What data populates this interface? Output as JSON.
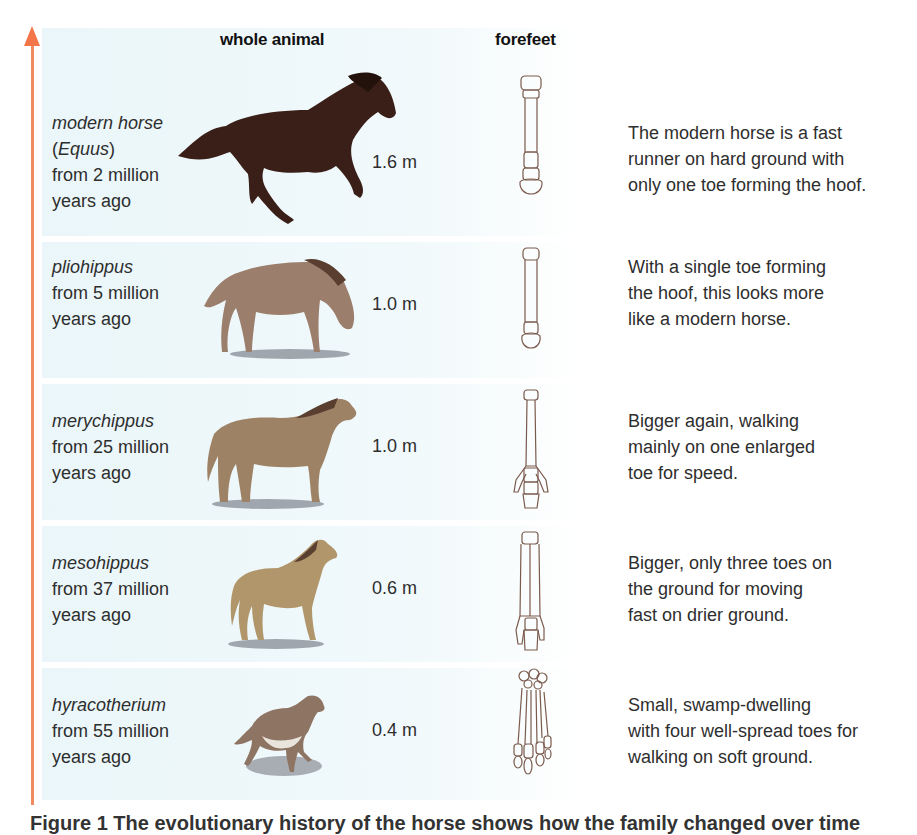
{
  "figure": {
    "headers": {
      "whole_animal": "whole animal",
      "forefeet": "forefeet"
    },
    "timeline_arrow": {
      "color": "#f3764a",
      "direction": "up",
      "meaning": "time (recent at top)"
    },
    "background_color": "#eaf6f9",
    "rows": [
      {
        "species": "modern horse",
        "label_line2": "(Equus)",
        "genus_italic": "Equus",
        "time_line1": "from 2 million",
        "time_line2": "years ago",
        "height": "1.6 m",
        "description": [
          "The modern horse is a fast",
          "runner on hard ground with",
          "only one toe forming the hoof."
        ],
        "animal_color": "#3a1f18",
        "toes": 1
      },
      {
        "species": "pliohippus",
        "time_line1": "from 5 million",
        "time_line2": "years ago",
        "height": "1.0 m",
        "description": [
          "With a single toe forming",
          "the hoof, this looks more",
          "like a modern horse."
        ],
        "animal_color": "#9c7e6c",
        "toes": 1
      },
      {
        "species": "merychippus",
        "time_line1": "from 25 million",
        "time_line2": "years ago",
        "height": "1.0 m",
        "description": [
          "Bigger again, walking",
          "mainly on one enlarged",
          "toe for speed."
        ],
        "animal_color": "#9e8266",
        "toes": 3
      },
      {
        "species": "mesohippus",
        "time_line1": "from 37 million",
        "time_line2": "years ago",
        "height": "0.6 m",
        "description": [
          "Bigger, only three toes on",
          "the ground for moving",
          "fast on drier ground."
        ],
        "animal_color": "#b0966a",
        "toes": 3
      },
      {
        "species": "hyracotherium",
        "time_line1": "from 55 million",
        "time_line2": "years ago",
        "height": "0.4 m",
        "description": [
          "Small, swamp-dwelling",
          "with four well-spread toes for",
          "walking on soft ground."
        ],
        "animal_color": "#8e7462",
        "toes": 4
      }
    ],
    "caption": "Figure 1 The evolutionary history of the horse shows how the family changed over time"
  }
}
